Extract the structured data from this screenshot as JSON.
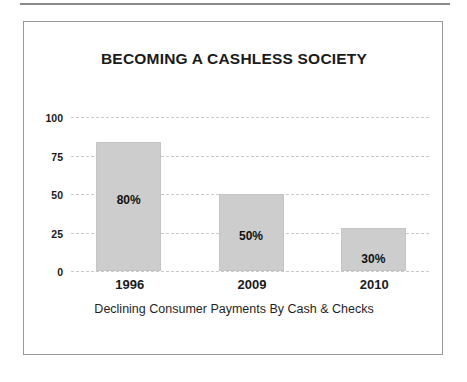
{
  "chart_data": {
    "type": "bar",
    "title": "BECOMING A CASHLESS SOCIETY",
    "caption": "Declining Consumer Payments By Cash & Checks",
    "categories": [
      "1996",
      "2009",
      "2010"
    ],
    "values": [
      84,
      50,
      28
    ],
    "data_labels": [
      "80%",
      "50%",
      "30%"
    ],
    "xlabel": "",
    "ylabel": "",
    "ylim": [
      0,
      100
    ],
    "yticks": [
      100,
      75,
      50,
      25,
      0
    ],
    "ytick_labels": [
      "100",
      "75",
      "50",
      "25",
      "0"
    ],
    "grid": true,
    "grid_style": "dashed-horizontal",
    "legend": false,
    "legend_position": "none",
    "colors": {
      "bar_fill": "#cdcdcd",
      "bar_border": "#c4c4c4",
      "gridline": "#c9c9c9",
      "text": "#1a1a1a",
      "frame_border": "#9a9a9a",
      "top_rule": "#8a8a8a",
      "background": "#ffffff"
    }
  }
}
